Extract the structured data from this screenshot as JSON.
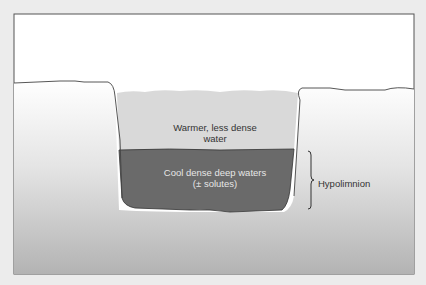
{
  "diagram": {
    "type": "lake stratification cross-section",
    "layers": {
      "upper": {
        "label_line1": "Warmer, less dense",
        "label_line2": "water",
        "color": "#d6d6d6"
      },
      "lower": {
        "label_line1": "Cool dense deep waters",
        "label_line2": "(± solutes)",
        "color": "#6b6b6b"
      }
    },
    "bracket": {
      "label": "Hypolimnion"
    },
    "colors": {
      "frame_bg": "#ffffff",
      "ground_top": "#ffffff",
      "ground_bottom": "#b5b5b5",
      "outline": "#444444",
      "page_bg": "#ececec"
    }
  }
}
